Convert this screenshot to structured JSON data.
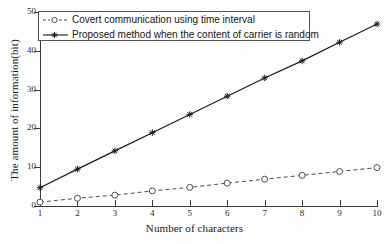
{
  "chart_data": {
    "type": "line",
    "title": "",
    "xlabel": "Number of characters",
    "ylabel": "The amount of information(bit)",
    "x": [
      1,
      2,
      3,
      4,
      5,
      6,
      7,
      8,
      9,
      10
    ],
    "xticks": [
      "1",
      "2",
      "3",
      "4",
      "5",
      "6",
      "7",
      "8",
      "9",
      "10"
    ],
    "yticks": [
      "0",
      "10",
      "20",
      "30",
      "40",
      "50"
    ],
    "xlim": [
      1,
      10
    ],
    "ylim": [
      0,
      50
    ],
    "grid": false,
    "legend_position": "upper left",
    "series": [
      {
        "name": "Covert communication using time interval",
        "values": [
          1.0,
          2.0,
          2.8,
          3.9,
          4.8,
          5.9,
          6.9,
          7.9,
          8.9,
          9.9
        ],
        "linestyle": "dashed",
        "marker": "circle-open",
        "color": "#4d4d4d"
      },
      {
        "name": "Proposed method when the content of carrier is random",
        "values": [
          4.7,
          9.5,
          14.2,
          18.9,
          23.6,
          28.3,
          33.0,
          37.4,
          42.2,
          46.9
        ],
        "linestyle": "solid",
        "marker": "star",
        "color": "#1a1a1a"
      }
    ]
  },
  "legend": {
    "items": [
      {
        "label": "Covert communication using time interval"
      },
      {
        "label": "Proposed method when the content of carrier is random"
      }
    ]
  },
  "axes": {
    "x_label": "Number of characters",
    "y_label": "The amount of information(bit)"
  }
}
